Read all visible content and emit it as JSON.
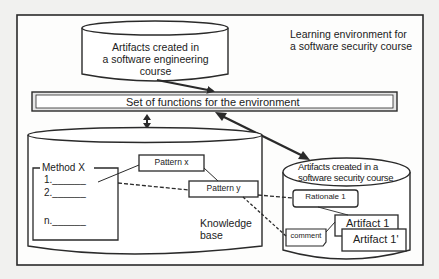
{
  "diagram": {
    "frame_label": [
      "Learning environment for",
      "a software security course"
    ],
    "se_artifacts": [
      "Artifacts created in",
      "a software engineering",
      "course"
    ],
    "functions_bar": "Set of functions for the environment",
    "knowledge_base": {
      "label": [
        "Knowledge",
        "base"
      ],
      "method": {
        "title": "Method X",
        "steps": [
          "1.______",
          "2.______",
          "n.______"
        ]
      },
      "patterns": [
        "Pattern x",
        "Pattern y"
      ]
    },
    "security_artifacts": {
      "label": [
        "Artifacts created in a",
        "software security course"
      ],
      "rationale": "Rationale 1",
      "comment": "comment",
      "artifacts": [
        "Artifact 1",
        "Artifact 1'"
      ]
    }
  },
  "colors": {
    "stroke": "#2a2a2a",
    "background": "#f1f1ef",
    "fill": "#ffffff"
  }
}
